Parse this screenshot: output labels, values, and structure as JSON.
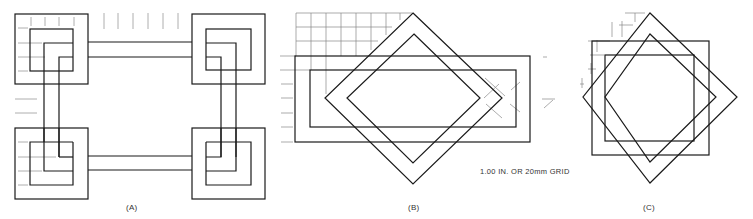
{
  "figure": {
    "panels": [
      {
        "id": "A",
        "label": "(A)",
        "description": "Four interlaced square corner knots joined by parallel bands forming a rectangle"
      },
      {
        "id": "B",
        "label": "(B)",
        "description": "Rectangular band interlaced with a diamond band"
      },
      {
        "id": "C",
        "label": "(C)",
        "description": "Square band interlaced with a rotated square (diamond) band forming an eight-pointed star"
      }
    ],
    "grid_note": "1.00 IN. OR 20mm GRID",
    "colors": {
      "line": "#1a1a1a",
      "grid": "#888888",
      "background": "#ffffff"
    }
  }
}
